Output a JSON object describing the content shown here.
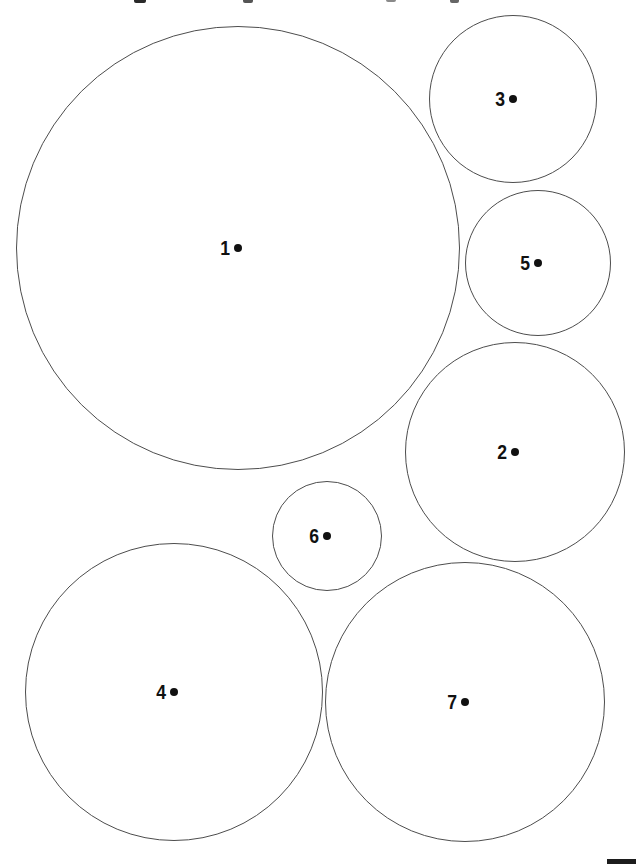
{
  "page": {
    "background": "#ffffff",
    "line_color": "#4d4d4d",
    "label_color": "#111111"
  },
  "figure": {
    "kind": "numbered-circle-packing",
    "circles": [
      {
        "label": "1",
        "cx": 238,
        "cy": 248,
        "r": 222
      },
      {
        "label": "2",
        "cx": 515,
        "cy": 452,
        "r": 110
      },
      {
        "label": "3",
        "cx": 513,
        "cy": 99,
        "r": 84
      },
      {
        "label": "4",
        "cx": 174,
        "cy": 692,
        "r": 149
      },
      {
        "label": "5",
        "cx": 538,
        "cy": 263,
        "r": 73
      },
      {
        "label": "6",
        "cx": 327,
        "cy": 536,
        "r": 55
      },
      {
        "label": "7",
        "cx": 465,
        "cy": 702,
        "r": 140
      }
    ]
  },
  "artifacts": {
    "top_text_fragments": [
      {
        "x": 134,
        "width": 12,
        "height": 3,
        "color": "#2a2a2a"
      },
      {
        "x": 243,
        "width": 10,
        "height": 3,
        "color": "#555555"
      },
      {
        "x": 386,
        "width": 10,
        "height": 2,
        "color": "#8a8a8a"
      },
      {
        "x": 450,
        "width": 9,
        "height": 3,
        "color": "#666666"
      }
    ],
    "corner_bar": {
      "x": 607,
      "y": 859,
      "width": 29,
      "height": 5,
      "color": "#1c1c1c"
    }
  }
}
